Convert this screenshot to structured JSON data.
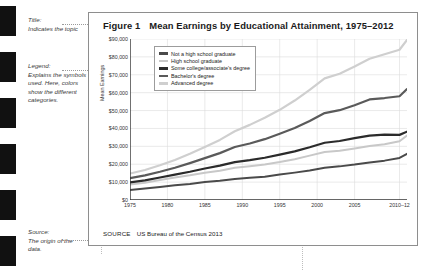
{
  "annotations": [
    {
      "name": "title",
      "label": "Title:",
      "text": "Indicates the topic",
      "top": 16
    },
    {
      "name": "legend",
      "label": "Legend:",
      "text": "Explains the symbols used. Here, colors show the different categories.",
      "top": 62
    },
    {
      "name": "source",
      "label": "Source:",
      "text": "The origin of the data.",
      "top": 228
    }
  ],
  "figure": {
    "number_label": "Figure 1",
    "title": "Mean Earnings by Educational Attainment, 1975–2012",
    "source_label": "SOURCE",
    "source_text": "US Bureau of the Census 2013"
  },
  "chart_data": {
    "type": "line",
    "title": "Mean Earnings by Educational Attainment, 1975–2012",
    "xlabel": "",
    "ylabel": "Mean Earnings",
    "xlim": [
      1975,
      2012
    ],
    "ylim": [
      0,
      90000
    ],
    "grid": true,
    "legend_position": "top-left-inside",
    "x_ticks": [
      "1975",
      "1980",
      "1985",
      "1990",
      "1995",
      "2000",
      "2005",
      "2010–12"
    ],
    "x_tick_values": [
      1975,
      1980,
      1985,
      1990,
      1995,
      2000,
      2005,
      2011
    ],
    "y_ticks": [
      "$0",
      "$10,000",
      "$20,000",
      "$30,000",
      "$40,000",
      "$50,000",
      "$60,000",
      "$70,000",
      "$80,000",
      "$90,000"
    ],
    "y_tick_values": [
      0,
      10000,
      20000,
      30000,
      40000,
      50000,
      60000,
      70000,
      80000,
      90000
    ],
    "x": [
      1975,
      1977,
      1979,
      1981,
      1983,
      1985,
      1987,
      1989,
      1991,
      1993,
      1995,
      1997,
      1999,
      2001,
      2003,
      2005,
      2007,
      2009,
      2011,
      2012
    ],
    "series": [
      {
        "name": "Not a high school graduate",
        "color": "#4a4a4a",
        "width": 2.0,
        "values": [
          5600,
          6400,
          7300,
          8200,
          9000,
          10000,
          10800,
          11800,
          12400,
          13000,
          14200,
          15300,
          16500,
          18000,
          18800,
          19800,
          21000,
          22000,
          23500,
          25800
        ]
      },
      {
        "name": "High school graduate",
        "color": "#c8c8c8",
        "width": 2.0,
        "values": [
          8600,
          9700,
          11200,
          12600,
          13800,
          15200,
          16400,
          18000,
          18900,
          19800,
          21200,
          22800,
          24800,
          26800,
          27500,
          28800,
          30200,
          31200,
          32800,
          36000
        ]
      },
      {
        "name": "Some college/associate's degree",
        "color": "#2b2b2b",
        "width": 2.2,
        "values": [
          9800,
          11000,
          12600,
          14200,
          15800,
          17600,
          19200,
          21200,
          22300,
          23600,
          25400,
          27200,
          29500,
          32000,
          33000,
          34600,
          36000,
          36600,
          36400,
          38200
        ]
      },
      {
        "name": "Bachelor's degree",
        "color": "#5a5a5a",
        "width": 2.2,
        "values": [
          12200,
          13800,
          15800,
          18000,
          20600,
          23400,
          26200,
          29600,
          31600,
          34000,
          37000,
          40200,
          44200,
          48600,
          50200,
          53000,
          56200,
          57000,
          58000,
          62000
        ]
      },
      {
        "name": "Advanced degree",
        "color": "#cfcfcf",
        "width": 2.2,
        "values": [
          14800,
          16800,
          19400,
          22400,
          25800,
          29600,
          33600,
          38400,
          42000,
          46000,
          50400,
          55600,
          61600,
          68000,
          70600,
          74600,
          79000,
          81500,
          84000,
          89500
        ]
      }
    ]
  }
}
